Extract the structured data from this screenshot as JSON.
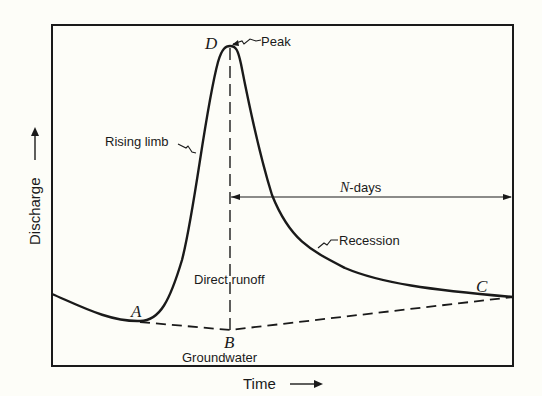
{
  "diagram": {
    "type": "hydrograph",
    "axes": {
      "x_label": "Time",
      "y_label": "Discharge"
    },
    "points": {
      "A": "A",
      "B": "B",
      "C": "C",
      "D": "D"
    },
    "annotations": {
      "peak": "Peak",
      "rising_limb": "Rising limb",
      "recession": "Recession",
      "n_days_prefix": "N",
      "n_days_suffix": "-days",
      "direct_runoff": "Direct runoff",
      "groundwater": "Groundwater"
    },
    "colors": {
      "line": "#1a1a1a",
      "background": "#fdfdf8"
    }
  }
}
